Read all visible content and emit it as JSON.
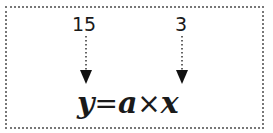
{
  "diagram": {
    "labels": [
      {
        "id": "a_value",
        "text": "15"
      },
      {
        "id": "x_value",
        "text": "3"
      }
    ],
    "equation": {
      "y": "y",
      "equals": "=",
      "a": "a",
      "times": "×",
      "x": "x"
    },
    "colors": {
      "text": "#1a1a1a",
      "border": "#777777"
    }
  }
}
